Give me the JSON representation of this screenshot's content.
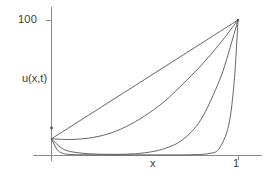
{
  "figure": {
    "background_color": "#ffffff",
    "line_color": "#555555",
    "axis_color": "#8a8a8a",
    "text_color": "#3b3b3b"
  },
  "chart_data": {
    "type": "line",
    "title": "",
    "subtitle": "",
    "xlabel": "x",
    "ylabel": "u(x,t)",
    "xlim": [
      0,
      1.15
    ],
    "ylim": [
      0,
      110
    ],
    "grid": false,
    "legend_position": "none",
    "xticks": [
      1
    ],
    "xticklabels": [
      "1"
    ],
    "yticks": [
      100
    ],
    "yticklabels": [
      "100"
    ],
    "annotations": [],
    "series": [
      {
        "name": "t1",
        "comment": "straight line from left boundary to (1,100)",
        "x": [
          0.0,
          0.1,
          0.2,
          0.3,
          0.4,
          0.5,
          0.6,
          0.7,
          0.8,
          0.9,
          1.0
        ],
        "values": [
          12,
          20.8,
          29.6,
          38.4,
          47.2,
          56,
          64.8,
          73.6,
          82.4,
          91.2,
          100
        ]
      },
      {
        "name": "t2",
        "comment": "gently convex curve, nearly flat near x=0",
        "x": [
          0.0,
          0.1,
          0.2,
          0.3,
          0.4,
          0.5,
          0.6,
          0.7,
          0.8,
          0.9,
          1.0
        ],
        "values": [
          12,
          11.5,
          12.5,
          15.5,
          21,
          29,
          39,
          52,
          66,
          82,
          100
        ]
      },
      {
        "name": "t3",
        "comment": "dips to near zero then rises steeply after x=0.55",
        "x": [
          0.0,
          0.05,
          0.1,
          0.2,
          0.3,
          0.4,
          0.5,
          0.6,
          0.7,
          0.8,
          0.9,
          0.95,
          1.0
        ],
        "values": [
          12,
          5.5,
          2.6,
          0.9,
          0.5,
          0.6,
          1.6,
          4.5,
          11,
          26,
          55,
          76,
          100
        ]
      },
      {
        "name": "t4",
        "comment": "drops immediately to zero, rises almost vertically at x=0.88",
        "x": [
          0.0,
          0.03,
          0.06,
          0.1,
          0.2,
          0.4,
          0.6,
          0.75,
          0.85,
          0.9,
          0.95,
          0.98,
          1.0
        ],
        "values": [
          12,
          4.0,
          1.3,
          0.4,
          0.15,
          0.1,
          0.1,
          0.2,
          1.2,
          5,
          22,
          55,
          100
        ]
      }
    ]
  },
  "axes": {
    "y_tick_100": "100",
    "y_axis_title": "u(x,t)",
    "x_tick_1": "1",
    "x_axis_title": "x"
  }
}
